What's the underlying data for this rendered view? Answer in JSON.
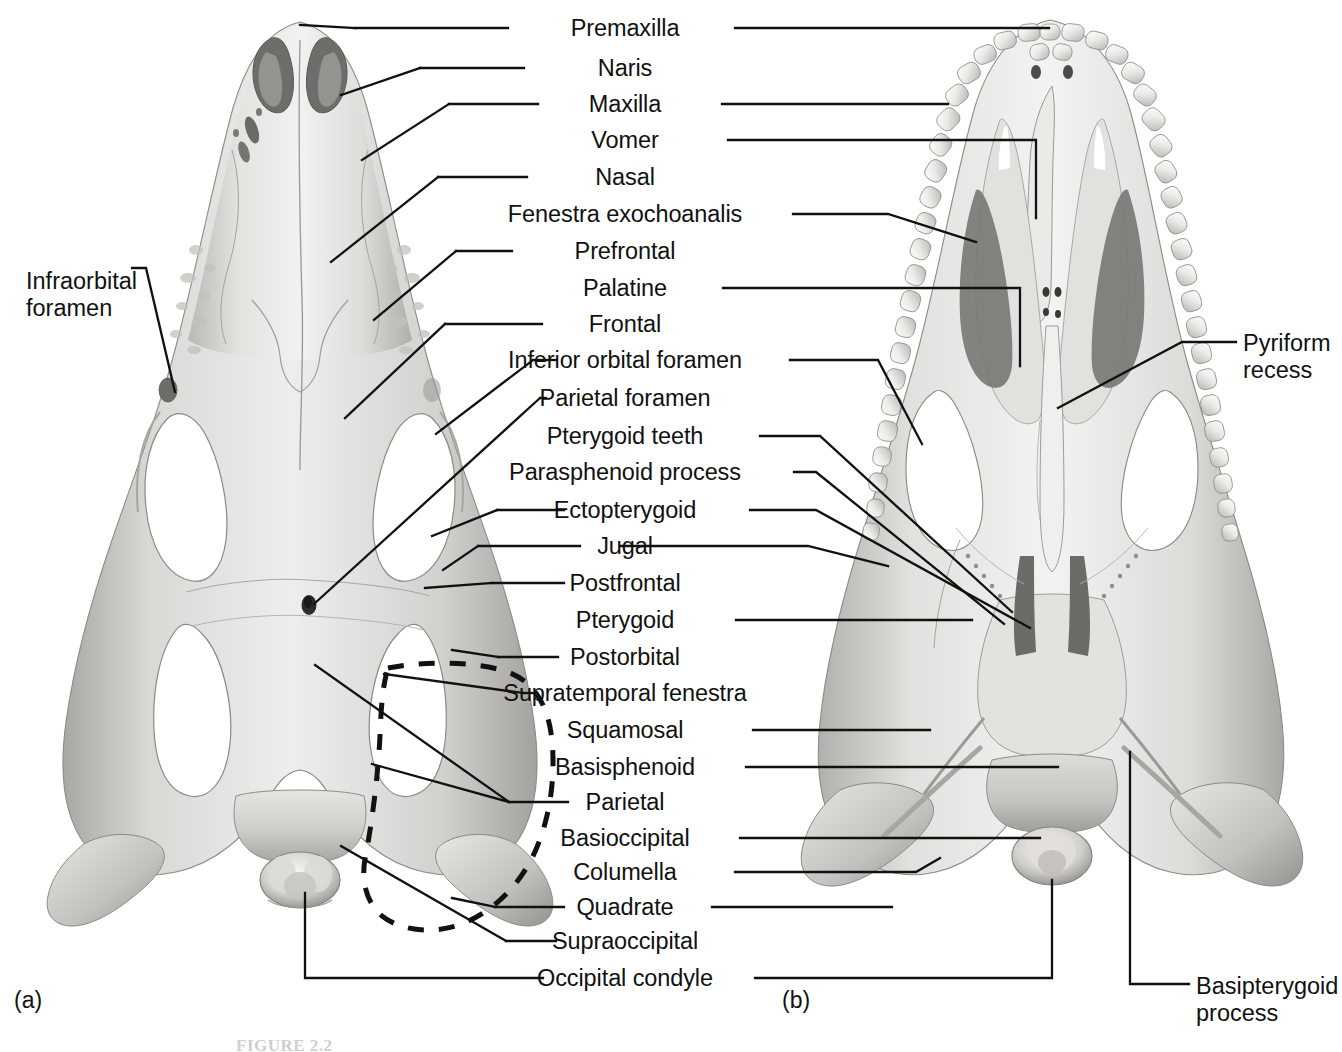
{
  "figure": {
    "caption_number": "FIGURE 2.2",
    "caption_text": "FIGURE 2.2   Skull of the American alligator",
    "panels": [
      {
        "id": "a",
        "letter": "(a)",
        "view": "dorsal view"
      },
      {
        "id": "b",
        "letter": "(b)",
        "view": "ventral (palatal) view"
      }
    ],
    "colors": {
      "background": "#ffffff",
      "leader_line": "#111111",
      "text": "#111111",
      "bone_light": "#f2f1ef",
      "bone_mid": "#cdcbc7",
      "bone_dark": "#9b9996",
      "bone_shadow": "#6e6c69",
      "fenestra": "#ffffff",
      "cavity": "#6a6865"
    }
  },
  "center_labels": [
    {
      "id": "premaxilla",
      "text": "Premaxilla",
      "y": 28,
      "left_leader": true,
      "right_leader": true
    },
    {
      "id": "naris",
      "text": "Naris",
      "y": 68,
      "left_leader": true,
      "right_leader": false
    },
    {
      "id": "maxilla",
      "text": "Maxilla",
      "y": 104,
      "left_leader": true,
      "right_leader": true
    },
    {
      "id": "vomer",
      "text": "Vomer",
      "y": 140,
      "left_leader": false,
      "right_leader": true
    },
    {
      "id": "nasal",
      "text": "Nasal",
      "y": 177,
      "left_leader": true,
      "right_leader": false
    },
    {
      "id": "fenestra-exochoanalis",
      "text": "Fenestra exochoanalis",
      "y": 214,
      "left_leader": false,
      "right_leader": true
    },
    {
      "id": "prefrontal",
      "text": "Prefrontal",
      "y": 251,
      "left_leader": true,
      "right_leader": false
    },
    {
      "id": "palatine",
      "text": "Palatine",
      "y": 288,
      "left_leader": false,
      "right_leader": true
    },
    {
      "id": "frontal",
      "text": "Frontal",
      "y": 324,
      "left_leader": true,
      "right_leader": false
    },
    {
      "id": "inferior-orbital-foramen",
      "text": "Inferior orbital foramen",
      "y": 360,
      "left_leader": true,
      "right_leader": true
    },
    {
      "id": "parietal-foramen",
      "text": "Parietal foramen",
      "y": 398,
      "left_leader": true,
      "right_leader": false
    },
    {
      "id": "pterygoid-teeth",
      "text": "Pterygoid teeth",
      "y": 436,
      "left_leader": false,
      "right_leader": true
    },
    {
      "id": "parasphenoid-process",
      "text": "Parasphenoid process",
      "y": 472,
      "left_leader": false,
      "right_leader": true
    },
    {
      "id": "ectopterygoid",
      "text": "Ectopterygoid",
      "y": 510,
      "left_leader": true,
      "right_leader": true
    },
    {
      "id": "jugal",
      "text": "Jugal",
      "y": 546,
      "left_leader": true,
      "right_leader": true
    },
    {
      "id": "postfrontal",
      "text": "Postfrontal",
      "y": 583,
      "left_leader": true,
      "right_leader": false
    },
    {
      "id": "pterygoid",
      "text": "Pterygoid",
      "y": 620,
      "left_leader": false,
      "right_leader": true
    },
    {
      "id": "postorbital",
      "text": "Postorbital",
      "y": 657,
      "left_leader": true,
      "right_leader": false
    },
    {
      "id": "supratemporal-fenestra",
      "text": "Supratemporal fenestra",
      "y": 693,
      "left_leader": true,
      "right_leader": false
    },
    {
      "id": "squamosal",
      "text": "Squamosal",
      "y": 730,
      "left_leader": false,
      "right_leader": true
    },
    {
      "id": "basisphenoid",
      "text": "Basisphenoid",
      "y": 767,
      "left_leader": false,
      "right_leader": true
    },
    {
      "id": "parietal",
      "text": "Parietal",
      "y": 802,
      "left_leader": true,
      "right_leader": false
    },
    {
      "id": "basioccipital",
      "text": "Basioccipital",
      "y": 838,
      "left_leader": false,
      "right_leader": true
    },
    {
      "id": "columella",
      "text": "Columella",
      "y": 872,
      "left_leader": false,
      "right_leader": true
    },
    {
      "id": "quadrate",
      "text": "Quadrate",
      "y": 907,
      "left_leader": true,
      "right_leader": true
    },
    {
      "id": "supraoccipital",
      "text": "Supraoccipital",
      "y": 941,
      "left_leader": true,
      "right_leader": false
    },
    {
      "id": "occipital-condyle",
      "text": "Occipital condyle",
      "y": 978,
      "left_leader": true,
      "right_leader": true
    }
  ],
  "margin_labels": [
    {
      "id": "infraorbital-foramen",
      "lines": [
        "Infraorbital",
        "foramen"
      ],
      "x": 26,
      "y": 268,
      "align": "left",
      "side": "left"
    },
    {
      "id": "pyriform-recess",
      "lines": [
        "Pyriform",
        "recess"
      ],
      "x": 1243,
      "y": 330,
      "align": "left",
      "side": "right"
    },
    {
      "id": "basipterygoid-process",
      "lines": [
        "Basipterygoid",
        "process"
      ],
      "x": 1196,
      "y": 973,
      "align": "left",
      "side": "right"
    }
  ],
  "panel_letters": [
    {
      "id": "panel-a",
      "text": "(a)",
      "x": 14,
      "y": 987
    },
    {
      "id": "panel-b",
      "text": "(b)",
      "x": 782,
      "y": 987
    }
  ],
  "annotations": {
    "dashed_outline": {
      "id": "supratemporal-fenestra-outline",
      "description": "Dashed closed curve outlining the right supratemporal fenestra region on the dorsal view",
      "style": "dashed"
    }
  }
}
